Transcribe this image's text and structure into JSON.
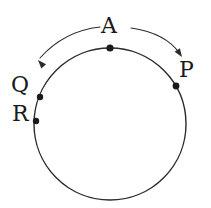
{
  "figure": {
    "type": "geometry-diagram",
    "background_color": "#ffffff",
    "stroke_color": "#2b2b2b",
    "point_color": "#1a1a1a",
    "label_color": "#1a1a1a"
  },
  "circle": {
    "center_x": 110,
    "center_y": 124,
    "radius": 76,
    "stroke_width": 1.4,
    "fill": "none"
  },
  "points": [
    {
      "id": "point-a",
      "label": "A",
      "cx": 110,
      "cy": 48,
      "r": 3.6,
      "label_x": 101,
      "label_y": 15
    },
    {
      "id": "point-p",
      "label": "P",
      "cx": 176,
      "cy": 86,
      "r": 3.4,
      "label_x": 179,
      "label_y": 59
    },
    {
      "id": "point-q",
      "label": "Q",
      "cx": 40,
      "cy": 97,
      "r": 3.2,
      "label_x": 11,
      "label_y": 74
    },
    {
      "id": "point-r",
      "label": "R",
      "cx": 36,
      "cy": 121,
      "r": 3.2,
      "label_x": 12,
      "label_y": 103
    }
  ],
  "arrows": [
    {
      "id": "arrow-left",
      "direction": "counterclockwise",
      "path": "M 100 27 Q 64 31 40 58",
      "tip_x": 38,
      "tip_y": 60,
      "head_angle_deg": 228,
      "stroke_width": 1.1
    },
    {
      "id": "arrow-right",
      "direction": "clockwise",
      "path": "M 131 28 Q 166 33 180 54",
      "tip_x": 182,
      "tip_y": 57,
      "head_angle_deg": 56,
      "stroke_width": 1.1
    }
  ]
}
